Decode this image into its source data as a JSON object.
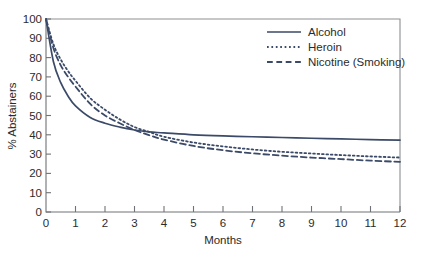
{
  "chart_data": {
    "type": "line",
    "title": "",
    "xlabel": "Months",
    "ylabel": "% Abstainers",
    "xlim": [
      0,
      12
    ],
    "ylim": [
      0,
      100
    ],
    "grid": false,
    "legend_position": "top-right",
    "xticks": [
      "0",
      "1",
      "2",
      "3",
      "4",
      "5",
      "6",
      "7",
      "8",
      "9",
      "10",
      "11",
      "12"
    ],
    "yticks": [
      "0",
      "10",
      "20",
      "30",
      "40",
      "50",
      "60",
      "70",
      "80",
      "90",
      "100"
    ],
    "x": [
      0,
      0.25,
      0.5,
      0.75,
      1,
      1.5,
      2,
      2.5,
      3,
      3.5,
      4,
      5,
      6,
      7,
      8,
      9,
      10,
      11,
      12
    ],
    "series": [
      {
        "name": "Alcohol",
        "style": "solid",
        "color": "#3b4a68",
        "values": [
          100,
          78,
          67,
          60,
          55,
          49,
          46,
          44,
          42.5,
          41.5,
          41,
          40,
          39.4,
          39,
          38.6,
          38.2,
          37.9,
          37.5,
          37.2
        ]
      },
      {
        "name": "Heroin",
        "style": "dotted",
        "color": "#3b4a68",
        "values": [
          100,
          87,
          79,
          73,
          68,
          59,
          53,
          48,
          44,
          41.5,
          39,
          36,
          34,
          32.4,
          31.2,
          30.3,
          29.5,
          28.8,
          28.2
        ]
      },
      {
        "name": "Nicotine (Smoking)",
        "style": "dashed",
        "color": "#3b4a68",
        "values": [
          100,
          85,
          76,
          70,
          65,
          56,
          50,
          46,
          42.5,
          39.8,
          37.5,
          34.2,
          32,
          30.4,
          29.2,
          28.2,
          27.4,
          26.6,
          26.0
        ]
      }
    ]
  },
  "legend": {
    "items": [
      {
        "label": "Alcohol",
        "style": "solid"
      },
      {
        "label": "Heroin",
        "style": "dotted"
      },
      {
        "label": "Nicotine (Smoking)",
        "style": "dashed"
      }
    ]
  },
  "axes": {
    "x_title": "Months",
    "y_title": "% Abstainers"
  },
  "colors": {
    "series": "#3b4a68",
    "frame": "#8d8f92",
    "axis": "#6f7276",
    "text": "#2b2b2b",
    "background": "#ffffff"
  }
}
